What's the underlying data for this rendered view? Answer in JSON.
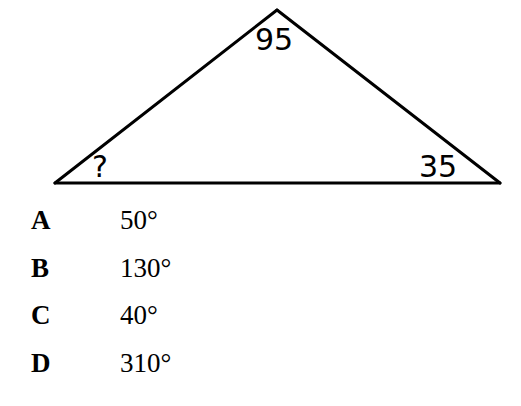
{
  "background_color": "#ffffff",
  "stroke_color": "#000000",
  "figure": {
    "shape": "triangle",
    "vertices": {
      "left": {
        "x": 55,
        "y": 183
      },
      "apex": {
        "x": 277,
        "y": 10
      },
      "right": {
        "x": 500,
        "y": 183
      }
    },
    "labels": {
      "apex": "95",
      "left": "?",
      "right": "35"
    }
  },
  "question": {
    "unknown_marker": "?",
    "known_angles": [
      95,
      35
    ]
  },
  "options": [
    {
      "letter": "A",
      "value": "50°"
    },
    {
      "letter": "B",
      "value": "130°"
    },
    {
      "letter": "C",
      "value": "40°"
    },
    {
      "letter": "D",
      "value": "310°"
    }
  ]
}
